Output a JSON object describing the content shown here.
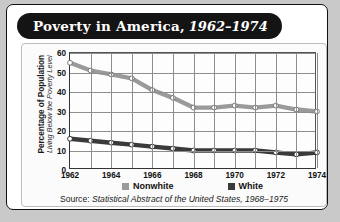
{
  "card": {
    "title_main": "Poverty in America,",
    "title_years": "1962–1974"
  },
  "axis": {
    "y_caption_line1": "Percentage of Population",
    "y_caption_line2": "Living Below the Poverty Level",
    "y_ticks": [
      "0",
      "10",
      "20",
      "30",
      "40",
      "50",
      "60"
    ],
    "x_ticks": [
      "1962",
      "1964",
      "1966",
      "1968",
      "1970",
      "1972",
      "1974"
    ]
  },
  "legend": {
    "items": [
      {
        "label": "Nonwhite",
        "color": "#9a9a9a"
      },
      {
        "label": "White",
        "color": "#3a3a3a"
      }
    ]
  },
  "source": {
    "prefix": "Source: ",
    "italic": "Statistical Abstract of the United States, 1968–1975"
  },
  "colors": {
    "nonwhite": "#9a9a9a",
    "white": "#3a3a3a",
    "marker_fill": "#ffffff",
    "marker_stroke": "#3a3a3a",
    "grid": "#8d8d8d",
    "axis": "#333333",
    "card_bg": "#ffffff",
    "page_bg": "#c9c9c9",
    "title_bg": "#141414"
  },
  "chart_data": {
    "type": "line",
    "title": "Poverty in America, 1962–1974",
    "xlabel": "",
    "ylabel": "Percentage of Population Living Below the Poverty Level",
    "xlim": [
      1962,
      1974
    ],
    "ylim": [
      0,
      60
    ],
    "grid": true,
    "legend_position": "bottom",
    "x": [
      1962,
      1963,
      1964,
      1965,
      1966,
      1967,
      1968,
      1969,
      1970,
      1971,
      1972,
      1973,
      1974
    ],
    "series": [
      {
        "name": "Nonwhite",
        "color": "#9a9a9a",
        "values": [
          55,
          51,
          49,
          47,
          41,
          37,
          32,
          32,
          33,
          32,
          33,
          31,
          30
        ]
      },
      {
        "name": "White",
        "color": "#3a3a3a",
        "values": [
          16,
          15,
          14,
          13,
          12,
          11,
          10,
          10,
          10,
          10,
          9,
          8,
          9
        ]
      }
    ]
  }
}
